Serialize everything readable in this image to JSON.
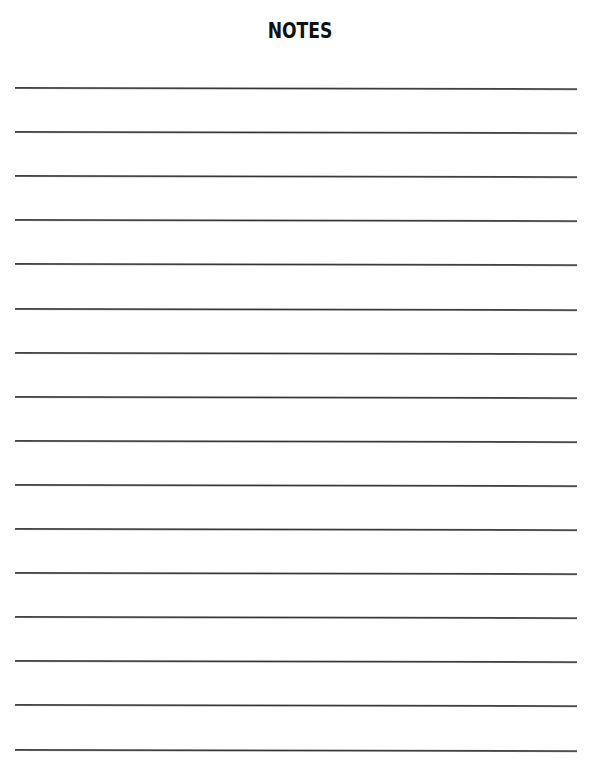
{
  "page": {
    "title": "NOTES",
    "line_count": 16,
    "line_color": "#333333",
    "background": "#ffffff"
  }
}
